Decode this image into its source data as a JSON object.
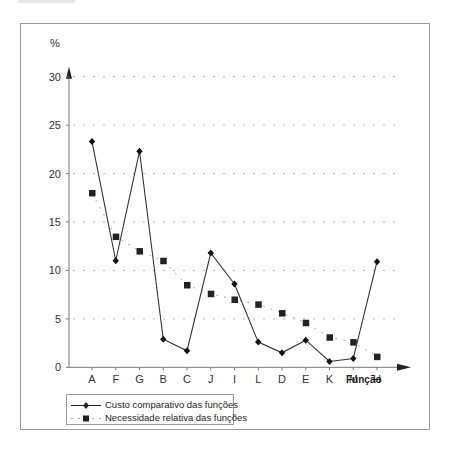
{
  "chart_data": {
    "type": "line",
    "title": "",
    "xlabel": "Função",
    "ylabel": "%",
    "ylim": [
      0,
      30
    ],
    "yticks": [
      0,
      5,
      10,
      15,
      20,
      25,
      30
    ],
    "grid": {
      "horizontal": true,
      "style": "dashed",
      "color": "#b0b0b0"
    },
    "legend_position": "bottom-left, below plot",
    "categories": [
      "A",
      "F",
      "G",
      "B",
      "C",
      "J",
      "I",
      "L",
      "D",
      "E",
      "K",
      "M",
      "H"
    ],
    "series": [
      {
        "name": "Custo comparativo das funções",
        "style": "solid line",
        "marker": "diamond",
        "color": "#222222",
        "values": [
          23.3,
          11.0,
          22.3,
          2.9,
          1.7,
          11.8,
          8.6,
          2.6,
          1.5,
          2.8,
          0.6,
          0.9,
          10.9
        ]
      },
      {
        "name": "Necessidade relativa das funções",
        "style": "dashed line",
        "marker": "square",
        "color": "#222222",
        "values": [
          18.0,
          13.5,
          12.0,
          11.0,
          8.5,
          7.6,
          7.0,
          6.5,
          5.6,
          4.6,
          3.1,
          2.6,
          1.1
        ]
      }
    ]
  },
  "axes": {
    "y_unit_label": "%",
    "x_title": "Função",
    "y_tick_labels": [
      "0",
      "5",
      "10",
      "15",
      "20",
      "25",
      "30"
    ]
  },
  "legend": {
    "items": [
      {
        "label": "Custo comparativo das funções"
      },
      {
        "label": "Necessidade relativa das funções"
      }
    ]
  }
}
